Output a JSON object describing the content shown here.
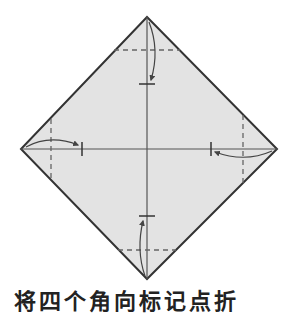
{
  "diagram": {
    "type": "origami-fold-diagram",
    "colors": {
      "paper": "#e3e3e3",
      "outline": "#333333",
      "crease": "#555555",
      "dashed": "#666666",
      "arrow": "#444444"
    },
    "diamond": {
      "top": [
        147,
        17
      ],
      "right": [
        277,
        149
      ],
      "bottom": [
        147,
        279
      ],
      "left": [
        21,
        149
      ]
    },
    "folds": [
      {
        "corner": "top",
        "dashed_line": "valley-fold",
        "target_mark": [
          147,
          84
        ]
      },
      {
        "corner": "bottom",
        "dashed_line": "valley-fold",
        "target_mark": [
          147,
          216
        ]
      },
      {
        "corner": "left",
        "dashed_line": "valley-fold",
        "target_mark": [
          82,
          149
        ]
      },
      {
        "corner": "right",
        "dashed_line": "valley-fold",
        "target_mark": [
          211,
          149
        ]
      }
    ]
  },
  "caption": {
    "text": "将四个角向标记点折"
  }
}
